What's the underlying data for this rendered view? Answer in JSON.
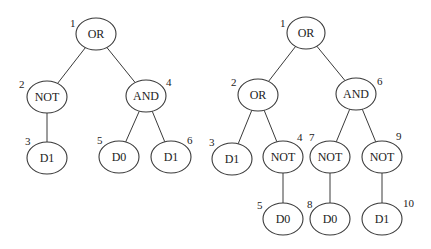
{
  "diagram": {
    "type": "expression-trees",
    "stroke_color": "#3a3a3a",
    "background": "#ffffff",
    "trees": [
      {
        "name": "tree-left",
        "nodes": [
          {
            "id": 1,
            "label": "OR",
            "index": "1",
            "cx": 96,
            "cy": 34,
            "rx": 20,
            "ry": 16,
            "ix": 70,
            "iy": 27
          },
          {
            "id": 2,
            "label": "NOT",
            "index": "2",
            "cx": 47,
            "cy": 97,
            "rx": 20,
            "ry": 16,
            "ix": 19,
            "iy": 88
          },
          {
            "id": 3,
            "label": "D1",
            "index": "3",
            "cx": 47,
            "cy": 158,
            "rx": 20,
            "ry": 16,
            "ix": 25,
            "iy": 145
          },
          {
            "id": 4,
            "label": "AND",
            "index": "4",
            "cx": 146,
            "cy": 96,
            "rx": 20,
            "ry": 16,
            "ix": 166,
            "iy": 86
          },
          {
            "id": 5,
            "label": "D0",
            "index": "5",
            "cx": 119,
            "cy": 157,
            "rx": 20,
            "ry": 16,
            "ix": 97,
            "iy": 144
          },
          {
            "id": 6,
            "label": "D1",
            "index": "6",
            "cx": 171,
            "cy": 157,
            "rx": 20,
            "ry": 16,
            "ix": 187,
            "iy": 144
          }
        ],
        "edges": [
          [
            1,
            2
          ],
          [
            1,
            4
          ],
          [
            2,
            3
          ],
          [
            4,
            5
          ],
          [
            4,
            6
          ]
        ]
      },
      {
        "name": "tree-right",
        "nodes": [
          {
            "id": 1,
            "label": "OR",
            "index": "1",
            "cx": 306,
            "cy": 33,
            "rx": 19,
            "ry": 16,
            "ix": 280,
            "iy": 27
          },
          {
            "id": 2,
            "label": "OR",
            "index": "2",
            "cx": 258,
            "cy": 95,
            "rx": 20,
            "ry": 16,
            "ix": 231,
            "iy": 86
          },
          {
            "id": 3,
            "label": "D1",
            "index": "3",
            "cx": 232,
            "cy": 159,
            "rx": 20,
            "ry": 16,
            "ix": 209,
            "iy": 146
          },
          {
            "id": 4,
            "label": "NOT",
            "index": "4",
            "cx": 283,
            "cy": 157,
            "rx": 20,
            "ry": 16,
            "ix": 297,
            "iy": 141
          },
          {
            "id": 5,
            "label": "D0",
            "index": "5",
            "cx": 283,
            "cy": 219,
            "rx": 20,
            "ry": 16,
            "ix": 257,
            "iy": 209
          },
          {
            "id": 6,
            "label": "AND",
            "index": "6",
            "cx": 356,
            "cy": 94,
            "rx": 20,
            "ry": 16,
            "ix": 377,
            "iy": 85
          },
          {
            "id": 7,
            "label": "NOT",
            "index": "7",
            "cx": 330,
            "cy": 157,
            "rx": 20,
            "ry": 16,
            "ix": 309,
            "iy": 141
          },
          {
            "id": 8,
            "label": "D0",
            "index": "8",
            "cx": 330,
            "cy": 219,
            "rx": 20,
            "ry": 16,
            "ix": 307,
            "iy": 208
          },
          {
            "id": 9,
            "label": "NOT",
            "index": "9",
            "cx": 382,
            "cy": 157,
            "rx": 20,
            "ry": 16,
            "ix": 396,
            "iy": 140
          },
          {
            "id": 10,
            "label": "D1",
            "index": "10",
            "cx": 382,
            "cy": 219,
            "rx": 20,
            "ry": 16,
            "ix": 403,
            "iy": 207
          }
        ],
        "edges": [
          [
            1,
            2
          ],
          [
            1,
            6
          ],
          [
            2,
            3
          ],
          [
            2,
            4
          ],
          [
            4,
            5
          ],
          [
            6,
            7
          ],
          [
            6,
            9
          ],
          [
            7,
            8
          ],
          [
            9,
            10
          ]
        ]
      }
    ]
  }
}
